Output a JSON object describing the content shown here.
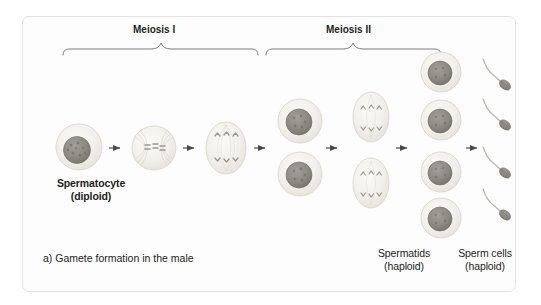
{
  "figure": {
    "caption": "a) Gamete formation in the male",
    "border_color": "#e3e3e3",
    "background": "#fdfdfd"
  },
  "phases": [
    {
      "id": "meiosis-i",
      "label": "Meiosis I"
    },
    {
      "id": "meiosis-ii",
      "label": "Meiosis II"
    }
  ],
  "labels": {
    "spermatocyte": {
      "name": "Spermatocyte",
      "ploidy": "(diploid)"
    },
    "spermatids": {
      "name": "Spermatids",
      "ploidy": "(haploid)"
    },
    "sperm_cells": {
      "name": "Sperm cells",
      "ploidy": "(haploid)"
    }
  },
  "colors": {
    "cytoplasm": "#f0eeea",
    "cytoplasm_edge": "#dedad2",
    "nucleus": "#8e8c85",
    "nucleus_edge": "#6f6d66",
    "chromosome": "#9a978f",
    "spindle": "#ddd9d1",
    "arrow": "#4a4a4a",
    "brace": "#6e6e6e",
    "text": "#231f20",
    "sperm_body": "#8b8880",
    "sperm_tail": "#b8b4ac"
  },
  "stages": [
    {
      "id": "spermatocyte",
      "order": 1,
      "kind": "round-cell",
      "count": 1,
      "description": "Primary spermatocyte with large granular nucleus"
    },
    {
      "id": "metaphase-i",
      "order": 2,
      "kind": "spindle-cell",
      "count": 1,
      "description": "Metaphase I, chromosomes aligned at equator with spindle"
    },
    {
      "id": "anaphase-i",
      "order": 3,
      "kind": "oval-chromosomes",
      "count": 1,
      "description": "Anaphase I, homologous chromosomes separating"
    },
    {
      "id": "secondary-spermatocytes",
      "order": 4,
      "kind": "round-cell",
      "count": 2,
      "description": "Two secondary spermatocytes"
    },
    {
      "id": "anaphase-ii",
      "order": 5,
      "kind": "oval-chromosomes",
      "count": 2,
      "description": "Two cells in meiosis II with separating chromatids"
    },
    {
      "id": "spermatids",
      "order": 6,
      "kind": "round-cell",
      "count": 4,
      "description": "Four haploid spermatids"
    },
    {
      "id": "sperm-cells",
      "order": 7,
      "kind": "sperm",
      "count": 4,
      "description": "Four mature sperm cells with heads and flagella"
    }
  ],
  "arrows": {
    "count": 6,
    "direction": "right"
  }
}
